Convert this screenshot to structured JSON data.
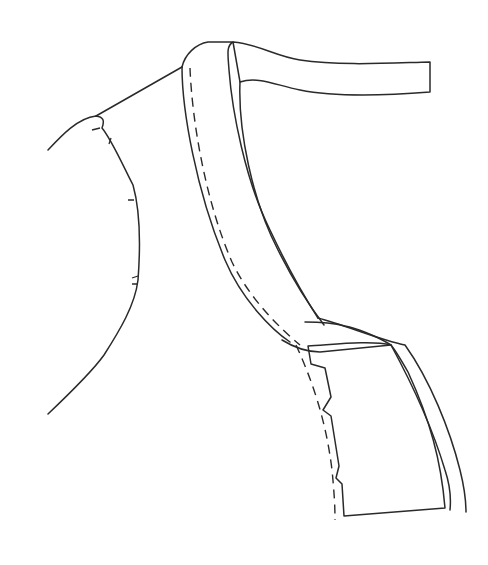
{
  "diagram": {
    "background": "#ffffff",
    "line_color": "#2a2a2a",
    "shaded_fill": "#c8c8c8",
    "hatch_color": "#3a3a3a",
    "parts": [
      {
        "name": "bodice-outline",
        "style": "solid"
      },
      {
        "name": "neck-binding",
        "style": "solid with dashed stitch line"
      },
      {
        "name": "wrong-side-strap",
        "style": "diagonal hatching"
      },
      {
        "name": "facing-panel",
        "style": "grey fill"
      },
      {
        "name": "notch-marks",
        "style": "short ticks"
      }
    ]
  }
}
